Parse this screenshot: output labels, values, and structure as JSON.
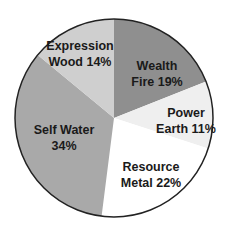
{
  "chart_data": {
    "type": "pie",
    "title": "",
    "start_angle_deg": 0,
    "direction": "clockwise",
    "slices": [
      {
        "name": "Wealth Fire",
        "line1": "Wealth",
        "line2": "Fire 19%",
        "value": 19,
        "color": "#8f8f8f",
        "label_pos": [
          157,
          74
        ]
      },
      {
        "name": "Power Earth",
        "line1": "Power",
        "line2": "Earth 11%",
        "value": 11,
        "color": "#efefef",
        "label_pos": [
          186,
          121
        ]
      },
      {
        "name": "Resource Metal",
        "line1": "Resource",
        "line2": "Metal 22%",
        "value": 22,
        "color": "#ffffff",
        "label_pos": [
          151,
          175
        ]
      },
      {
        "name": "Self Water",
        "line1": "Self Water",
        "line2": "34%",
        "value": 34,
        "color": "#a9a9a9",
        "label_pos": [
          64,
          138
        ]
      },
      {
        "name": "Expression Wood",
        "line1": "Expression",
        "line2": "Wood 14%",
        "value": 14,
        "color": "#cfcfcf",
        "label_pos": [
          80,
          54
        ]
      }
    ],
    "center": [
      114,
      118
    ],
    "radius": 99,
    "legend": "none",
    "stroke": "#222222"
  }
}
